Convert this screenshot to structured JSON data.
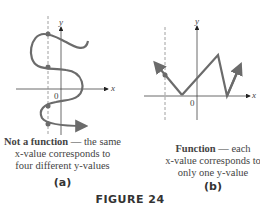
{
  "figure": {
    "label": "FIGURE 24",
    "accent_color": "#6b6b6b",
    "panels": [
      {
        "id": "a",
        "sublabel": "(a)",
        "caption_bold": "Not a function",
        "caption_rest": " — the same",
        "caption_line2": "x-value corresponds to",
        "caption_line3": "four different y-values",
        "axis_x": "x",
        "axis_y": "y",
        "origin": "0"
      },
      {
        "id": "b",
        "sublabel": "(b)",
        "caption_bold": "Function",
        "caption_rest": " — each",
        "caption_line2": "x-value corresponds to",
        "caption_line3": "only one y-value",
        "axis_x": "x",
        "axis_y": "y",
        "origin": "0"
      }
    ]
  }
}
